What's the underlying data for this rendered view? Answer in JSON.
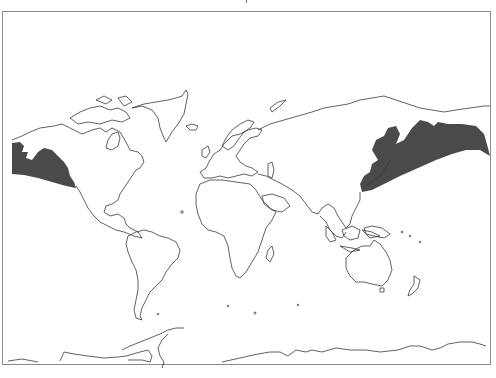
{
  "map": {
    "type": "world-outline",
    "projection": "Mercator-like, Atlantic-centered",
    "shaded_region": {
      "description": "North Pacific distribution range",
      "fill_color": "#4a4a4a",
      "parts": [
        "Gulf of Alaska / Pacific Northwest coast (left edge)",
        "Japan, Kuril Islands, Kamchatka, Bering Sea, Aleutians (right edge)"
      ]
    },
    "outline_color": "#3a3a3a",
    "frame_color": "#8a8a8a",
    "background_color": "#ffffff"
  }
}
